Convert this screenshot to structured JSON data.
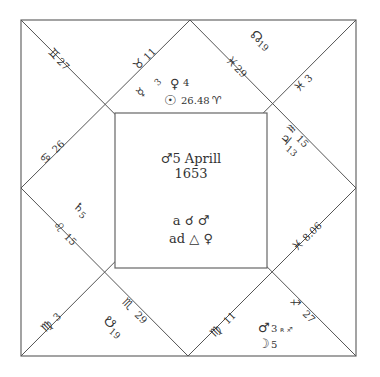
{
  "title": {
    "line1": "♂5 Aprill",
    "line2": "1653"
  },
  "aspects": {
    "line1": "a ☌ ♂",
    "line2": "ad △ ♀"
  },
  "cusps": [
    {
      "id": "cusp-10-gemini",
      "sign": "♊",
      "degree": "27"
    },
    {
      "id": "cusp-11-taurus",
      "sign": "♉",
      "degree": "11"
    },
    {
      "id": "cusp-12-pisces",
      "sign": "♓",
      "degree": "29"
    },
    {
      "id": "cusp-1-pisces",
      "sign": "♓",
      "degree": "3"
    },
    {
      "id": "cusp-2-aquarius",
      "sign": "♒",
      "degree": "15"
    },
    {
      "id": "cusp-3-pisces",
      "sign": "♓",
      "degree": "8.06"
    },
    {
      "id": "cusp-4-sagittarius",
      "sign": "♐",
      "degree": "27"
    },
    {
      "id": "cusp-5-virgo",
      "sign": "♍",
      "degree": "11"
    },
    {
      "id": "cusp-6-scorpio",
      "sign": "♏",
      "degree": "29"
    },
    {
      "id": "cusp-7-virgo",
      "sign": "♍",
      "degree": "3"
    },
    {
      "id": "cusp-8-leo",
      "sign": "♌",
      "degree": "15"
    },
    {
      "id": "cusp-9-cancer",
      "sign": "♋",
      "degree": "26"
    }
  ],
  "planets": {
    "mercury": {
      "glyph": "☿",
      "degree": "3"
    },
    "venus": {
      "glyph": "♀",
      "degree": "4"
    },
    "sun": {
      "glyph": "☉",
      "degree": "26.48",
      "sign": "♈"
    },
    "north_node": {
      "glyph": "☊",
      "degree": "19"
    },
    "jupiter": {
      "glyph": "♃",
      "degree": "13"
    },
    "saturn": {
      "glyph": "♄",
      "degree": "5"
    },
    "south_node": {
      "glyph": "☋",
      "degree": "19"
    },
    "mars": {
      "glyph": "♂",
      "degree": "3",
      "note": "ʀ ♐"
    },
    "moon": {
      "glyph": "☽",
      "degree": "5"
    }
  }
}
